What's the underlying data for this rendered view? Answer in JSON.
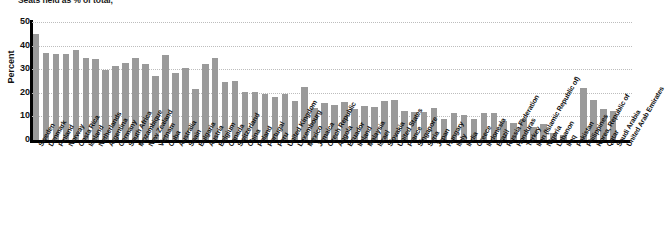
{
  "chart_data": {
    "type": "bar",
    "title": "Seats held as % of total,",
    "xlabel": "",
    "ylabel": "Percent",
    "ylim": [
      0,
      50
    ],
    "yticks": [
      0,
      10,
      20,
      30,
      40,
      50
    ],
    "grid": true,
    "grid_style": "dotted",
    "legend": null,
    "bar_color": "#9a9a9a",
    "axis_color": "#000000",
    "categories": [
      "Sweden",
      "Denmark",
      "Finland",
      "Norway",
      "Costa Rica",
      "Iceland",
      "Netherlands",
      "Argentina",
      "Germany",
      "South Africa",
      "Mozambique",
      "New Zealand",
      "Vietnam",
      "Cuba",
      "Australia",
      "Spain",
      "Bulgaria",
      "Austria",
      "Belgium",
      "Canada",
      "Switzerland",
      "China",
      "Poland",
      "Portugal",
      "Peru",
      "United Kingdom",
      "Luxembourg",
      "Mexico",
      "Jamaica",
      "Czech Republic",
      "Angola",
      "Ecuador",
      "Ireland",
      "Malaysia",
      "Israel",
      "Slovakia",
      "United States",
      "France",
      "Singapore",
      "Syria",
      "Japan",
      "Hungary",
      "Italy",
      "India",
      "Greece",
      "Indonesia",
      "Brazil",
      "Russia Federation",
      "Honduras",
      "Turkey",
      "Iran (Islamic Republic of)",
      "Nigeria",
      "Lebanon",
      "Iraq",
      "Pakistan",
      "Philippines",
      "Korea, Republic of",
      "Qatar",
      "Saudi Arabia",
      "United Arab Emirates"
    ],
    "values": [
      45.0,
      36.9,
      36.5,
      36.4,
      38.0,
      34.9,
      34.2,
      29.6,
      31.3,
      32.8,
      34.8,
      32.2,
      27.3,
      36.0,
      28.3,
      30.5,
      21.7,
      32.2,
      34.7,
      24.7,
      24.8,
      20.3,
      20.2,
      19.5,
      18.3,
      19.7,
      16.7,
      22.6,
      13.6,
      15.5,
      15.0,
      16.3,
      13.3,
      14.6,
      14.2,
      16.7,
      16.8,
      12.2,
      11.8,
      12.0,
      13.4,
      9.1,
      11.5,
      10.8,
      8.7,
      11.3,
      11.6,
      8.0,
      7.4,
      9.1,
      5.6,
      6.7,
      3.1,
      2.3,
      0.0,
      22.1,
      17.0,
      13.0,
      12.4,
      0.0
    ]
  }
}
